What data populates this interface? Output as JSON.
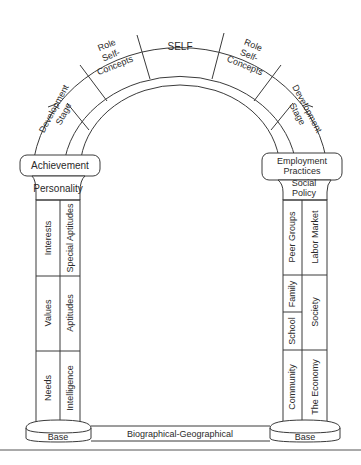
{
  "diagram": {
    "arch": {
      "keystone": "SELF",
      "left_upper": [
        "Role",
        "Self-",
        "Concepts"
      ],
      "right_upper": [
        "Role",
        "Self-",
        "Concepts"
      ],
      "left_lower": [
        "Development",
        "Stage"
      ],
      "right_lower": [
        "Development",
        "Stage"
      ]
    },
    "left_column": {
      "capital": "Achievement",
      "neck": "Personality",
      "inner_segments": [
        "Interests",
        "Values",
        "Needs"
      ],
      "outer_segments": [
        "Special Aptitudes",
        "Aptitudes",
        "Intelligence"
      ],
      "base": "Base"
    },
    "right_column": {
      "capital": [
        "Employment",
        "Practices"
      ],
      "neck": [
        "Social",
        "Policy"
      ],
      "inner_segments": [
        "Peer Groups",
        "Family",
        "School",
        "Community"
      ],
      "outer_segments": [
        "Labor Market",
        "Society",
        "The Economy"
      ],
      "base": "Base"
    },
    "foundation": "Biographical-Geographical"
  }
}
